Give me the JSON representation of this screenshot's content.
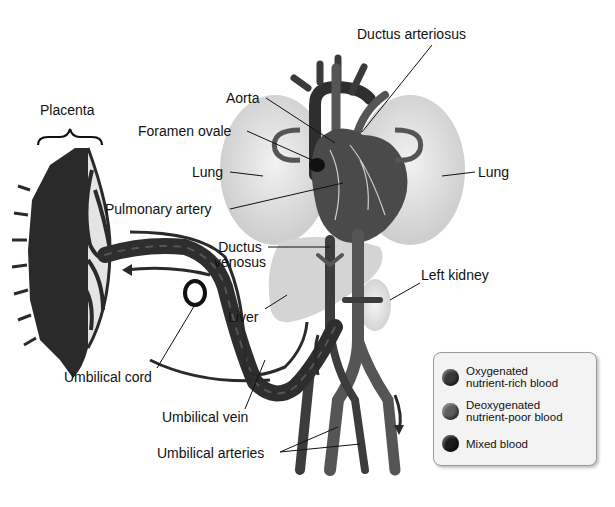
{
  "labels": {
    "placenta": "Placenta",
    "foramen_ovale": "Foramen ovale",
    "aorta": "Aorta",
    "ductus_arteriosus": "Ductus arteriosus",
    "lung_left": "Lung",
    "lung_right": "Lung",
    "pulmonary_artery": "Pulmonary artery",
    "ductus_venosus_1": "Ductus",
    "ductus_venosus_2": "venosus",
    "liver": "Liver",
    "left_kidney": "Left kidney",
    "umbilical_cord": "Umbilical cord",
    "umbilical_vein": "Umbilical vein",
    "umbilical_arteries": "Umbilical arteries"
  },
  "legend": {
    "items": [
      {
        "line1": "Oxygenated",
        "line2": "nutrient-rich blood",
        "color": "#3a3a3a"
      },
      {
        "line1": "Deoxygenated",
        "line2": "nutrient-poor blood",
        "color": "#5e5e5e"
      },
      {
        "line1": "Mixed blood",
        "line2": "",
        "color": "#1c1c1c"
      }
    ]
  },
  "colors": {
    "vessel_dark": "#2e2e2e",
    "vessel_mid": "#555555",
    "organ_light": "#dcdcdc",
    "heart": "#4a4a4a"
  }
}
